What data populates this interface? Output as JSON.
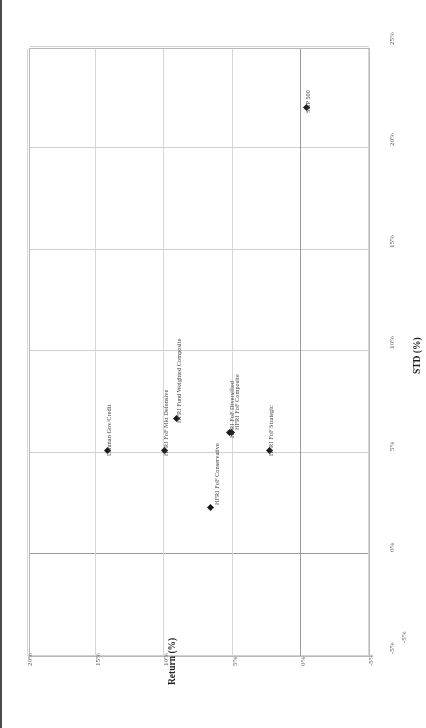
{
  "chart_data": {
    "type": "scatter",
    "title": "",
    "xlabel": "Return (%)",
    "ylabel": "STD (%)",
    "xlim": [
      -5,
      20
    ],
    "ylim": [
      -5,
      25
    ],
    "x_tick_labels": [
      "20%",
      "15%",
      "10%",
      "5%",
      "0%",
      "-5%"
    ],
    "x_tick_values": [
      20,
      15,
      10,
      5,
      0,
      -5
    ],
    "y_tick_labels": [
      "25%",
      "20%",
      "15%",
      "10%",
      "5%",
      "0%",
      "-5%"
    ],
    "y_tick_values": [
      25,
      20,
      15,
      10,
      5,
      0,
      -5
    ],
    "x_axis_reversed": true,
    "y_axis_reversed": true,
    "grid": true,
    "legend": "none",
    "marker_color": "#1a1a1a",
    "grid_color": "#cfcfcf",
    "frame_color": "#b9b9b9",
    "points": [
      {
        "label": "S&P 500",
        "return": -0.4,
        "std": 22.0
      },
      {
        "label": "Lehman Gov/Credit",
        "return": 14.2,
        "std": 5.1
      },
      {
        "label": "HFRI FoF Mkt Defensive",
        "return": 10.0,
        "std": 5.1
      },
      {
        "label": "HFRI Fund Weighted Composite",
        "return": 9.1,
        "std": 6.7
      },
      {
        "label": "HFRI FoF Diversified",
        "return": 5.2,
        "std": 6.0
      },
      {
        "label": "HFRI FoF Composite",
        "return": 5.1,
        "std": 6.0
      },
      {
        "label": "HFRI FoF Strategic",
        "return": 2.3,
        "std": 5.1
      },
      {
        "label": "HFRI FoF Conservative",
        "return": 6.6,
        "std": 2.3
      }
    ]
  }
}
